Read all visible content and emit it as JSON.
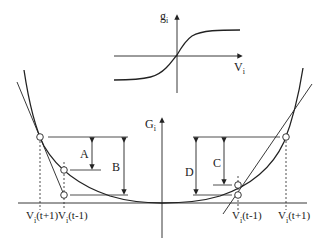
{
  "inset": {
    "y_axis_label": "g",
    "y_axis_sub": "i",
    "x_axis_label": "V",
    "x_axis_sub": "i",
    "curve": "sigmoid"
  },
  "main": {
    "y_axis_label": "G",
    "y_axis_sub": "i",
    "curve": "convex U-shaped energy G_i(V_i)",
    "left_labels": {
      "v_t_plus_1": {
        "base": "V",
        "sub": "i",
        "arg": "(t+1)"
      },
      "v_t_minus_1": {
        "base": "V",
        "sub": "i",
        "arg": "(t-1)"
      }
    },
    "right_labels": {
      "v_t_minus_1": {
        "base": "V",
        "sub": "i",
        "arg": "(t-1)"
      },
      "v_t_plus_1": {
        "base": "V",
        "sub": "i",
        "arg": "(t+1)"
      }
    },
    "intervals": {
      "A": "A",
      "B": "B",
      "C": "C",
      "D": "D"
    }
  },
  "colors": {
    "line": "#222222",
    "background": "#ffffff"
  }
}
